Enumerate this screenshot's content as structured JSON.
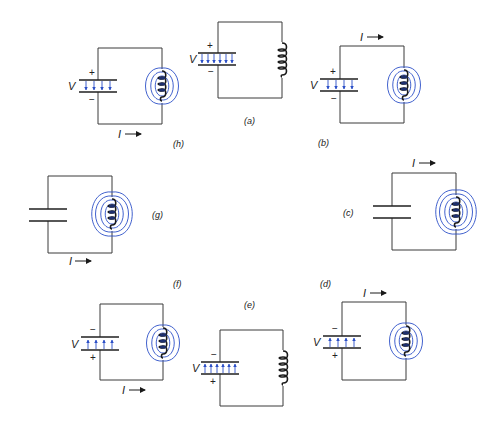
{
  "diagram": {
    "colors": {
      "wire": "#3a3a3a",
      "field_lines": "#2b4fc7",
      "plates": "#1f1f1f"
    },
    "stage_labels": {
      "a": "(a)",
      "b": "(b)",
      "c": "(c)",
      "d": "(d)",
      "e": "(e)",
      "f": "(f)",
      "g": "(g)",
      "h": "(h)"
    },
    "symbols": {
      "voltage": "V",
      "current": "I",
      "plus": "+",
      "minus": "−"
    },
    "circuits": [
      {
        "id": "h",
        "capacitor": "charged, + top",
        "inductor_field": true,
        "current": "below, rightward"
      },
      {
        "id": "a",
        "capacitor": "fully charged, + top",
        "inductor_field": false,
        "current": "none"
      },
      {
        "id": "b",
        "capacitor": "charged, + top",
        "inductor_field": true,
        "current": "above, rightward"
      },
      {
        "id": "c",
        "capacitor": "uncharged",
        "inductor_field": true,
        "current": "above, rightward"
      },
      {
        "id": "d",
        "capacitor": "charged, − top",
        "inductor_field": true,
        "current": "above, rightward"
      },
      {
        "id": "e",
        "capacitor": "fully charged, − top",
        "inductor_field": false,
        "current": "none"
      },
      {
        "id": "f",
        "capacitor": "charged, − top",
        "inductor_field": true,
        "current": "below, rightward"
      },
      {
        "id": "g",
        "capacitor": "uncharged",
        "inductor_field": true,
        "current": "below, rightward"
      }
    ]
  }
}
